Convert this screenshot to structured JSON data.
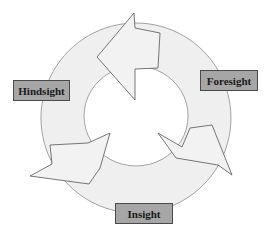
{
  "diagram": {
    "type": "cycle",
    "direction": "counter-clockwise",
    "colors": {
      "ring_fill": "#efefef",
      "ring_stroke": "#8c8c8c",
      "arrow_fill": "#f2f2f2",
      "arrow_stroke": "#555555",
      "label_fill": "#a6a6a6",
      "label_border": "#4a4a4a",
      "label_text": "#1a1a1a"
    },
    "stages": [
      {
        "id": "hindsight",
        "label": "Hindsight"
      },
      {
        "id": "foresight",
        "label": "Foresight"
      },
      {
        "id": "insight",
        "label": "Insight"
      }
    ],
    "arrows": [
      {
        "name": "top-arrow",
        "points_to": "left"
      },
      {
        "name": "right-arrow",
        "points_to": "lower-right"
      },
      {
        "name": "left-arrow",
        "points_to": "lower-left"
      }
    ]
  }
}
